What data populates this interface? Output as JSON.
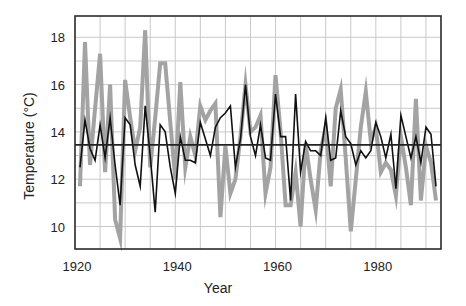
{
  "chart_data": {
    "type": "line",
    "title": "",
    "xlabel": "Year",
    "ylabel": "Temperature (°C)",
    "xlim": [
      1920,
      1993
    ],
    "ylim": [
      9.05,
      18.9
    ],
    "x_ticks": [
      1920,
      1940,
      1960,
      1980
    ],
    "y_ticks": [
      10,
      12,
      14,
      16,
      18
    ],
    "grid": {
      "x_step": 5,
      "y_step": 1,
      "on": true
    },
    "legend": null,
    "reference_line": {
      "name": "mean",
      "value": 13.45,
      "color": "#222222"
    },
    "series": [
      {
        "name": "gray-series",
        "color": "#a3a3a3",
        "width": 4,
        "x": [
          1921,
          1922,
          1923,
          1924,
          1925,
          1926,
          1927,
          1928,
          1929,
          1930,
          1931,
          1932,
          1933,
          1934,
          1935,
          1936,
          1937,
          1938,
          1939,
          1940,
          1941,
          1942,
          1943,
          1944,
          1945,
          1946,
          1947,
          1948,
          1949,
          1950,
          1951,
          1952,
          1953,
          1954,
          1955,
          1956,
          1957,
          1958,
          1959,
          1960,
          1961,
          1962,
          1963,
          1964,
          1965,
          1966,
          1967,
          1968,
          1969,
          1970,
          1971,
          1972,
          1973,
          1974,
          1975,
          1976,
          1977,
          1978,
          1979,
          1980,
          1981,
          1982,
          1983,
          1984,
          1985,
          1986,
          1987,
          1988,
          1989,
          1990,
          1991,
          1992
        ],
        "values": [
          11.7,
          17.8,
          12.6,
          15.0,
          17.3,
          12.3,
          16.0,
          10.3,
          9.5,
          16.2,
          14.6,
          13.2,
          14.2,
          18.3,
          12.5,
          14.6,
          16.9,
          16.9,
          14.4,
          12.0,
          16.1,
          12.5,
          13.8,
          13.0,
          15.1,
          14.5,
          14.9,
          15.2,
          10.4,
          13.4,
          11.4,
          12.0,
          13.8,
          16.0,
          14.0,
          14.2,
          14.7,
          11.4,
          12.5,
          16.4,
          14.0,
          10.9,
          10.9,
          12.3,
          10.0,
          13.5,
          12.0,
          10.7,
          13.2,
          14.2,
          11.7,
          15.0,
          15.8,
          12.9,
          9.8,
          12.0,
          14.2,
          15.7,
          13.6,
          14.2,
          12.3,
          12.7,
          12.4,
          11.3,
          13.8,
          12.5,
          10.9,
          15.4,
          11.1,
          13.4,
          12.7,
          11.1
        ]
      },
      {
        "name": "black-series",
        "color": "#111111",
        "width": 1.6,
        "x": [
          1921,
          1922,
          1923,
          1924,
          1925,
          1926,
          1927,
          1928,
          1929,
          1930,
          1931,
          1932,
          1933,
          1934,
          1935,
          1936,
          1937,
          1938,
          1939,
          1940,
          1941,
          1942,
          1943,
          1944,
          1945,
          1946,
          1947,
          1948,
          1949,
          1950,
          1951,
          1952,
          1953,
          1954,
          1955,
          1956,
          1957,
          1958,
          1959,
          1960,
          1961,
          1962,
          1963,
          1964,
          1965,
          1966,
          1967,
          1968,
          1969,
          1970,
          1971,
          1972,
          1973,
          1974,
          1975,
          1976,
          1977,
          1978,
          1979,
          1980,
          1981,
          1982,
          1983,
          1984,
          1985,
          1986,
          1987,
          1988,
          1989,
          1990,
          1991,
          1992
        ],
        "values": [
          12.5,
          14.5,
          13.3,
          12.8,
          14.3,
          12.9,
          14.6,
          12.6,
          10.9,
          14.6,
          14.3,
          12.6,
          11.7,
          15.1,
          13.0,
          10.6,
          14.3,
          14.0,
          12.5,
          11.4,
          13.8,
          12.8,
          12.8,
          12.7,
          14.4,
          13.7,
          13.0,
          14.2,
          14.6,
          14.8,
          15.1,
          12.5,
          13.7,
          16.0,
          13.8,
          13.0,
          14.3,
          12.9,
          12.8,
          15.6,
          13.8,
          13.8,
          11.1,
          15.6,
          12.3,
          13.6,
          13.2,
          13.2,
          13.0,
          14.6,
          12.8,
          12.9,
          14.9,
          13.8,
          13.5,
          12.6,
          13.2,
          12.9,
          13.2,
          14.4,
          13.8,
          12.9,
          13.9,
          11.6,
          14.7,
          13.8,
          12.9,
          13.8,
          12.7,
          14.2,
          13.9,
          11.7
        ]
      }
    ]
  },
  "layout": {
    "plot": {
      "left": 75,
      "top": 16,
      "right": 441,
      "bottom": 249
    },
    "colors": {
      "grid": "#c9c9c9",
      "frame": "#2a2a2a",
      "text": "#222222"
    }
  }
}
